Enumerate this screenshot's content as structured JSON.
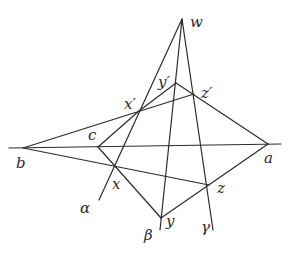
{
  "diagram": {
    "stroke_color": "#2b2b2b",
    "points": {
      "w": {
        "x": 182,
        "y": 19,
        "label": "w",
        "lx": 190,
        "ly": 27
      },
      "a": {
        "x": 268,
        "y": 144,
        "label": "a",
        "lx": 264,
        "ly": 163
      },
      "b": {
        "x": 23,
        "y": 148,
        "label": "b",
        "lx": 16,
        "ly": 168
      },
      "c": {
        "x": 98,
        "y": 147,
        "label": "c",
        "lx": 88,
        "ly": 140
      },
      "x": {
        "x": 115,
        "y": 168,
        "label": "x",
        "lx": 112,
        "ly": 189
      },
      "y": {
        "x": 161,
        "y": 218,
        "label": "y",
        "lx": 166,
        "ly": 226
      },
      "z": {
        "x": 209,
        "y": 185,
        "label": "z",
        "lx": 217,
        "ly": 193
      },
      "x'": {
        "x": 139,
        "y": 111,
        "label": "x′",
        "lx": 124,
        "ly": 109
      },
      "y'": {
        "x": 176,
        "y": 83,
        "label": "y′",
        "lx": 158,
        "ly": 87
      },
      "z'": {
        "x": 194,
        "y": 94,
        "label": "z′",
        "lx": 201,
        "ly": 98
      }
    },
    "line_labels": {
      "alpha": {
        "label": "α",
        "lx": 80,
        "ly": 213
      },
      "beta": {
        "label": "β",
        "lx": 144,
        "ly": 240
      },
      "gamma": {
        "label": "γ",
        "lx": 201,
        "ly": 232
      }
    },
    "segments": [
      {
        "name": "line-alpha",
        "from": [
          182,
          19
        ],
        "to": [
          99,
          200
        ]
      },
      {
        "name": "line-beta",
        "from": [
          182,
          19
        ],
        "to": [
          160,
          230
        ]
      },
      {
        "name": "line-gamma",
        "from": [
          182,
          19
        ],
        "to": [
          213,
          230
        ]
      },
      {
        "name": "line-ba-axis",
        "from": [
          9,
          148
        ],
        "to": [
          281,
          144
        ]
      },
      {
        "name": "line-b-xprime-zprime",
        "from": [
          23,
          148
        ],
        "to": [
          194,
          94
        ]
      },
      {
        "name": "line-b-x-z",
        "from": [
          23,
          148
        ],
        "to": [
          209,
          185
        ]
      },
      {
        "name": "line-a-yprime",
        "from": [
          268,
          144
        ],
        "to": [
          176,
          83
        ]
      },
      {
        "name": "line-a-y",
        "from": [
          268,
          144
        ],
        "to": [
          161,
          218
        ]
      },
      {
        "name": "line-c-xprime",
        "from": [
          98,
          147
        ],
        "to": [
          139,
          111
        ]
      },
      {
        "name": "line-c-y",
        "from": [
          98,
          147
        ],
        "to": [
          161,
          218
        ]
      },
      {
        "name": "line-xprime-yprime",
        "from": [
          139,
          111
        ],
        "to": [
          176,
          83
        ]
      }
    ]
  }
}
